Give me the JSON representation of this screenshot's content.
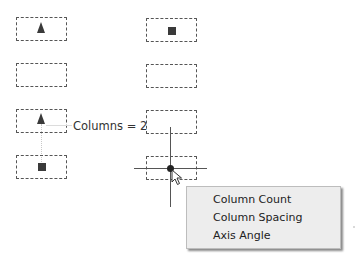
{
  "canvas": {
    "grid": {
      "columns": [
        {
          "cells": [
            {
              "marker": "triangle"
            },
            {
              "marker": "none"
            },
            {
              "marker": "triangle"
            },
            {
              "marker": "square"
            }
          ]
        },
        {
          "cells": [
            {
              "marker": "square"
            },
            {
              "marker": "none"
            },
            {
              "marker": "none"
            },
            {
              "marker": "none"
            }
          ]
        }
      ]
    },
    "columns_label": "Columns = 2",
    "crosshair": {
      "x": 170,
      "y": 168
    }
  },
  "context_menu": {
    "items": [
      {
        "label": "Column Count"
      },
      {
        "label": "Column Spacing"
      },
      {
        "label": "Axis Angle"
      }
    ]
  },
  "colors": {
    "marker": "#3a3a3a",
    "menu_bg": "#ededed",
    "cell_border": "#555555"
  }
}
